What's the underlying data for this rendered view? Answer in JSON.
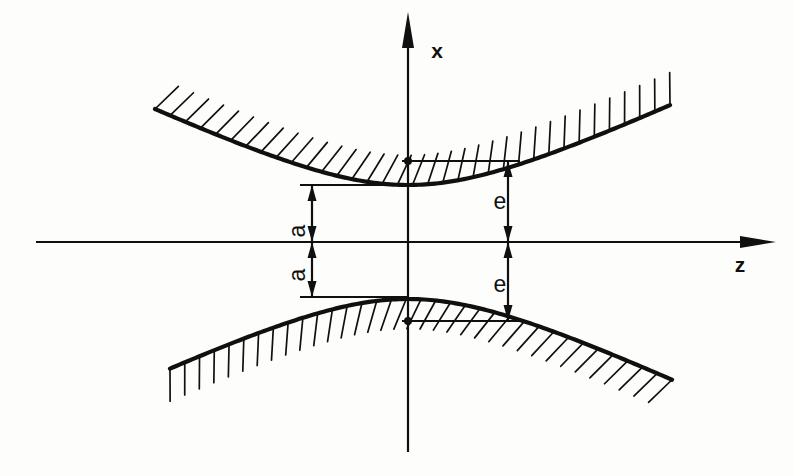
{
  "figure": {
    "background_color": "#fdfdfb",
    "ink_color": "#101010",
    "width": 794,
    "height": 476
  },
  "axes": {
    "vertical": {
      "name": "x",
      "label": "x",
      "label_x": 437,
      "label_y": 58,
      "line_x": 408,
      "top_y": 26,
      "bottom_y": 452,
      "arrow_at": "top"
    },
    "horizontal": {
      "name": "z",
      "label": "z",
      "label_x": 740,
      "label_y": 272,
      "line_y": 242,
      "left_x": 36,
      "right_x": 762,
      "arrow_at": "right"
    }
  },
  "dimensions": [
    {
      "id": "a-upper",
      "label": "a",
      "axis_x": 312,
      "from_y": 242,
      "to_y": 185,
      "label_x": 305,
      "label_y": 231,
      "arrow_ends": "both",
      "rotated": true
    },
    {
      "id": "a-lower",
      "label": "a",
      "axis_x": 312,
      "from_y": 242,
      "to_y": 297,
      "label_x": 305,
      "label_y": 275,
      "arrow_ends": "both",
      "rotated": true
    },
    {
      "id": "e-upper",
      "label": "e",
      "axis_x": 508,
      "from_y": 242,
      "to_y": 161,
      "label_x": 500,
      "label_y": 209,
      "arrow_ends": "both",
      "rotated": false
    },
    {
      "id": "e-lower",
      "label": "e",
      "axis_x": 508,
      "from_y": 242,
      "to_y": 321,
      "label_x": 500,
      "label_y": 292,
      "arrow_ends": "both",
      "rotated": false
    }
  ],
  "reference_lines": [
    {
      "id": "ref-a-upper",
      "y": 185,
      "x1": 300,
      "x2": 408
    },
    {
      "id": "ref-a-lower",
      "y": 297,
      "x1": 300,
      "x2": 408
    },
    {
      "id": "ref-e-upper",
      "y": 161,
      "x1": 402,
      "x2": 520
    },
    {
      "id": "ref-e-lower",
      "y": 321,
      "x1": 402,
      "x2": 520
    }
  ],
  "markers": [
    {
      "id": "marker-e-upper",
      "x": 408,
      "y": 161,
      "r": 4
    },
    {
      "id": "marker-e-lower",
      "x": 408,
      "y": 321,
      "r": 4
    }
  ],
  "chart_data": {
    "type": "line",
    "xlabel": "z",
    "ylabel": "x",
    "grid": false,
    "legend": null,
    "origin_px": {
      "x": 408,
      "y": 242
    },
    "annotations": [
      {
        "text": "a",
        "meaning": "half-waist radius at z = 0",
        "value_px": 57
      },
      {
        "text": "a",
        "meaning": "half-waist radius at z = 0 (mirrored)",
        "value_px": 57
      },
      {
        "text": "e",
        "meaning": "envelope half-height at reference plane",
        "value_px": 81
      },
      {
        "text": "e",
        "meaning": "envelope half-height at reference plane (mirrored)",
        "value_px": 81
      }
    ],
    "curves": [
      {
        "name": "upper-branch",
        "branch": "upper",
        "vertex_px": {
          "x": 408,
          "y": 185
        },
        "a_px": 57,
        "b_px": 120,
        "z_range_px": [
          -253,
          262
        ],
        "hatch_side": "above",
        "hatch_count": 34,
        "hatch_length_px": 30
      },
      {
        "name": "lower-branch",
        "branch": "lower",
        "vertex_px": {
          "x": 408,
          "y": 297
        },
        "a_px": 57,
        "b_px": 120,
        "z_range_px": [
          -238,
          264
        ],
        "hatch_side": "below",
        "hatch_count": 34,
        "hatch_length_px": 30
      }
    ]
  }
}
